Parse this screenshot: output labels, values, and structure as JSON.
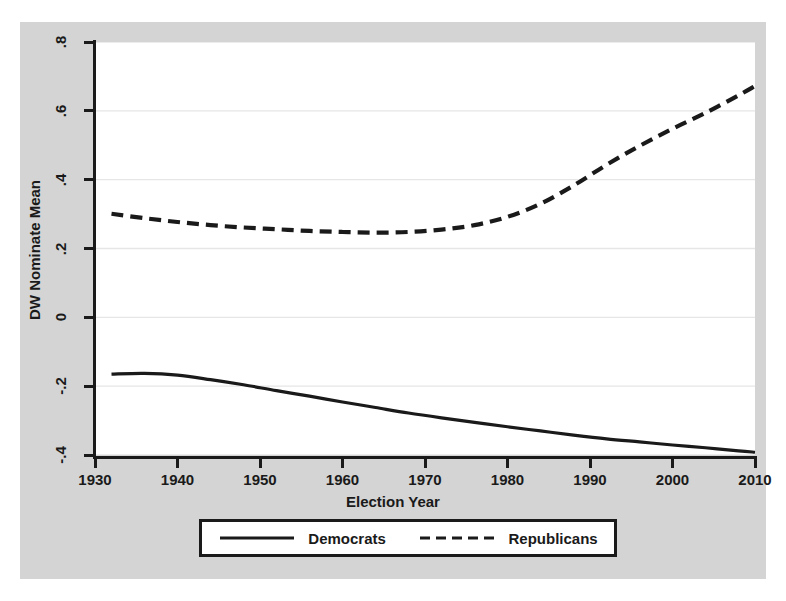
{
  "chart_data": {
    "type": "line",
    "title": "",
    "xlabel": "Election Year",
    "ylabel": "DW Nominate Mean",
    "xlim": [
      1930,
      2010
    ],
    "ylim": [
      -0.4,
      0.8
    ],
    "grid": true,
    "grid_orientation": "horizontal",
    "legend_position": "below-plot",
    "xticks": [
      1930,
      1940,
      1950,
      1960,
      1970,
      1980,
      1990,
      2000,
      2010
    ],
    "xtick_labels": [
      "1930",
      "1940",
      "1950",
      "1960",
      "1970",
      "1980",
      "1990",
      "2000",
      "2010"
    ],
    "yticks": [
      0.8,
      0.6,
      0.4,
      0.2,
      0,
      -0.2,
      -0.4
    ],
    "ytick_labels": [
      ".8",
      ".6",
      ".4",
      ".2",
      "0",
      "-.2",
      "-.4"
    ],
    "x": [
      1932,
      1936,
      1940,
      1944,
      1948,
      1952,
      1956,
      1960,
      1964,
      1968,
      1972,
      1976,
      1980,
      1984,
      1988,
      1992,
      1996,
      2000,
      2004,
      2008,
      2010
    ],
    "series": [
      {
        "name": "Democrats",
        "style": "solid",
        "color": "#1a1a1a",
        "values": [
          -0.165,
          -0.163,
          -0.168,
          -0.181,
          -0.196,
          -0.213,
          -0.229,
          -0.246,
          -0.262,
          -0.278,
          -0.292,
          -0.305,
          -0.318,
          -0.33,
          -0.342,
          -0.353,
          -0.362,
          -0.371,
          -0.379,
          -0.388,
          -0.392
        ]
      },
      {
        "name": "Republicans",
        "style": "dashed",
        "color": "#1a1a1a",
        "values": [
          0.301,
          0.288,
          0.277,
          0.268,
          0.261,
          0.256,
          0.251,
          0.248,
          0.246,
          0.248,
          0.255,
          0.268,
          0.292,
          0.33,
          0.383,
          0.443,
          0.498,
          0.548,
          0.594,
          0.645,
          0.672
        ]
      }
    ]
  },
  "axes": {
    "y_title": "DW Nominate Mean",
    "x_title": "Election Year"
  },
  "legend": {
    "entries": [
      {
        "label": "Democrats",
        "style": "solid"
      },
      {
        "label": "Republicans",
        "style": "dashed"
      }
    ]
  }
}
